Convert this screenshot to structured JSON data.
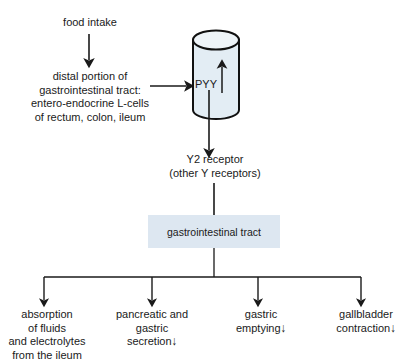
{
  "diagram": {
    "colors": {
      "cylinder_fill": "#e3edf4",
      "cylinder_stroke": "#111111",
      "box_fill": "#dde7f1",
      "line": "#222222",
      "text": "#1a1a1a",
      "background": "#ffffff"
    },
    "nodes": {
      "food_intake": {
        "label": "food intake"
      },
      "distal_source": {
        "lines": [
          "distal portion of",
          "gastrointestinal tract:",
          "entero-endocrine L-cells",
          "of rectum, colon, ileum"
        ]
      },
      "cylinder": {
        "label": "PYY",
        "change_arrow": "↑",
        "change_meaning": "increase"
      },
      "y2_receptor": {
        "lines": [
          "Y2 receptor",
          "(other Y receptors)"
        ]
      },
      "gi_tract_box": {
        "label": "gastrointestinal tract"
      }
    },
    "effects": [
      {
        "name": "absorption",
        "lines": [
          "absorption",
          "of fluids",
          "and electrolytes",
          "from the ileum"
        ],
        "change_arrow": ""
      },
      {
        "name": "pancreatic-gastric-secretion",
        "lines": [
          "pancreatic and",
          "gastric",
          "secretion"
        ],
        "change_arrow": "↓",
        "change_meaning": "decrease"
      },
      {
        "name": "gastric-emptying",
        "lines": [
          "gastric",
          "emptying"
        ],
        "change_arrow": "↓",
        "change_meaning": "decrease"
      },
      {
        "name": "gallbladder-contraction",
        "lines": [
          "gallbladder",
          "contraction"
        ],
        "change_arrow": "↓",
        "change_meaning": "decrease"
      }
    ]
  }
}
